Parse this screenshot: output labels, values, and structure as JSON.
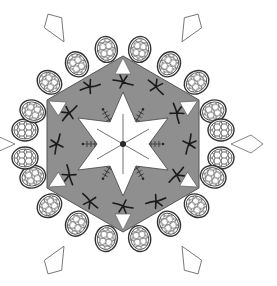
{
  "image": {
    "subject": "tessellation rosette of turtles and lizard-like creatures",
    "width": 277,
    "height": 286,
    "center": [
      123,
      144
    ],
    "colors": {
      "background": "#ffffff",
      "ring_fill": "#8f8f8f",
      "shell_fill": "#ffffff",
      "line": "#333333",
      "dark_mark": "#1a1a1a"
    },
    "turtle_count": 18,
    "outer_tail_count": 6
  }
}
